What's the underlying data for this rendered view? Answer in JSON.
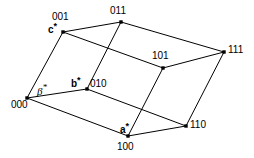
{
  "figure": {
    "background_color": "#ffffff",
    "line_color": "#000000",
    "vertex_color": "#000000",
    "width": 254,
    "height": 158
  },
  "vertices": [
    {
      "id": "v000",
      "label": "000",
      "x": 27,
      "y": 98,
      "label_x": 11,
      "label_y": 99
    },
    {
      "id": "v001",
      "label": "001",
      "x": 63,
      "y": 32,
      "label_x": 52,
      "label_y": 11
    },
    {
      "id": "v010",
      "label": "010",
      "x": 87,
      "y": 89,
      "label_x": 90,
      "label_y": 78
    },
    {
      "id": "v011",
      "label": "011",
      "x": 121,
      "y": 22,
      "label_x": 110,
      "label_y": 5
    },
    {
      "id": "v100",
      "label": "100",
      "x": 128,
      "y": 136,
      "label_x": 117,
      "label_y": 141
    },
    {
      "id": "v101",
      "label": "101",
      "x": 163,
      "y": 68,
      "label_x": 152,
      "label_y": 50
    },
    {
      "id": "v110",
      "label": "110",
      "x": 186,
      "y": 126,
      "label_x": 190,
      "label_y": 119
    },
    {
      "id": "v111",
      "label": "111",
      "x": 224,
      "y": 52,
      "label_x": 228,
      "label_y": 44
    }
  ],
  "edges": [
    {
      "id": "e-000-001",
      "from": "000",
      "to": "001"
    },
    {
      "id": "e-000-010",
      "from": "000",
      "to": "010"
    },
    {
      "id": "e-000-100",
      "from": "000",
      "to": "100"
    },
    {
      "id": "e-001-011",
      "from": "001",
      "to": "011"
    },
    {
      "id": "e-001-101",
      "from": "001",
      "to": "101"
    },
    {
      "id": "e-010-011",
      "from": "010",
      "to": "011"
    },
    {
      "id": "e-010-110",
      "from": "010",
      "to": "110"
    },
    {
      "id": "e-100-101",
      "from": "100",
      "to": "101"
    },
    {
      "id": "e-100-110",
      "from": "100",
      "to": "110"
    },
    {
      "id": "e-011-111",
      "from": "011",
      "to": "111"
    },
    {
      "id": "e-101-111",
      "from": "101",
      "to": "111"
    },
    {
      "id": "e-110-111",
      "from": "110",
      "to": "111"
    }
  ],
  "axis_labels": [
    {
      "id": "a-star",
      "symbol": "a",
      "star": "*",
      "x": 120,
      "y": 124
    },
    {
      "id": "b-star",
      "symbol": "b",
      "star": "*",
      "x": 71,
      "y": 78
    },
    {
      "id": "c-star",
      "symbol": "c",
      "star": "*",
      "x": 48,
      "y": 24
    }
  ],
  "angle_labels": [
    {
      "id": "beta-star",
      "symbol": "β",
      "star": "*",
      "x": 37,
      "y": 86
    }
  ]
}
